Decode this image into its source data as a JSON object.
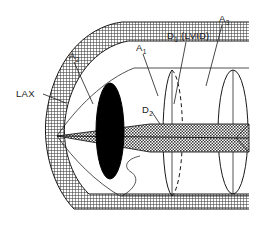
{
  "figure": {
    "background_color": "#ffffff",
    "ink_color": "#1a1a1a",
    "hatch_color": "#4a4a4a",
    "solid_fill_color": "#000000"
  },
  "labels": [
    {
      "id": "lax",
      "base": "LAX",
      "sub": "",
      "suffix": "",
      "text": "LAX",
      "x": 16,
      "y": 97,
      "leader": "M 43 94 L 66 103"
    },
    {
      "id": "a2",
      "base": "A",
      "sub": "2",
      "suffix": "",
      "text": "A2",
      "x": 69,
      "y": 59,
      "leader": "M 74 62 L 93 104"
    },
    {
      "id": "a1",
      "base": "A",
      "sub": "1",
      "suffix": "",
      "text": "A1",
      "x": 136,
      "y": 51,
      "leader": "M 143 54 L 158 96"
    },
    {
      "id": "d1",
      "base": "D",
      "sub": "1",
      "suffix": " (LVID)",
      "text": "D1 (LVID)",
      "x": 167,
      "y": 39,
      "leader": "M 186 42 L 174 104"
    },
    {
      "id": "a3",
      "base": "A",
      "sub": "3",
      "suffix": "",
      "text": "A3",
      "x": 219,
      "y": 22,
      "leader": "M 222 25 L 206 86"
    },
    {
      "id": "d2",
      "base": "D",
      "sub": "2",
      "suffix": "",
      "text": "D2",
      "x": 142,
      "y": 113,
      "leader": "M 152 112 L 160 124"
    }
  ],
  "geometry": {
    "apex_x": 57,
    "apex_y": 136,
    "right_edge_x": 249,
    "mid_ellipse_cx": 172,
    "mid_ellipse_rx": 13,
    "mid_ellipse_ry": 62,
    "right_ellipse_cx": 233,
    "right_ellipse_rx": 15,
    "right_ellipse_ry": 62,
    "black_ellipse_cx": 110,
    "black_ellipse_cy": 131,
    "black_ellipse_rx": 14,
    "black_ellipse_ry": 48,
    "plane_center_y": 138
  }
}
